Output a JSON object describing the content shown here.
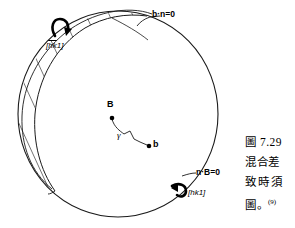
{
  "figure": {
    "number": "7.29",
    "caption_lines": [
      "圖 7.29",
      "混合差",
      "致時須",
      "圖。"
    ],
    "caption_reference_marker": "(9)",
    "caption_label_prefix": "圖"
  },
  "diagram": {
    "title": "圖 7.29",
    "shape": "sphere-with-hatched-band",
    "labels": {
      "plane_condition_top": "b·n=0",
      "plane_condition_bottom": "n·B=0",
      "direction_top": "[hk1]",
      "direction_top_overbars": "hk",
      "direction_bottom": "[hk1]",
      "point_B": "B",
      "point_b": "b",
      "angle_gamma": "γ"
    },
    "icons": {
      "rotation_arrow_top": "curved-arrow-icon",
      "rotation_arrow_bottom": "curved-arrow-icon",
      "node_B": "point-marker-icon",
      "node_b": "point-marker-icon"
    },
    "colors": {
      "stroke": "#1a1a1a",
      "background": "#ffffff",
      "hatch": "#3a3a3a",
      "text": "#000000"
    },
    "geometry": {
      "sphere_center_x": 118,
      "sphere_center_y": 114,
      "sphere_radius_x": 100,
      "sphere_radius_y": 103,
      "point_B_x": 112,
      "point_B_y": 116,
      "point_b_x": 149,
      "point_b_y": 146,
      "hatch_line_count": 9
    }
  }
}
